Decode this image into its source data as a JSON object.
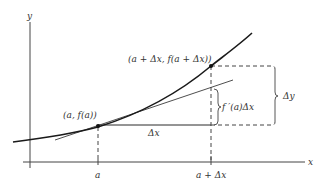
{
  "diagram": {
    "title": "",
    "axes": {
      "x_label": "x",
      "y_label": "y",
      "x_ticks": [
        {
          "label": "a"
        },
        {
          "label": "a + Δx"
        }
      ]
    },
    "points": [
      {
        "label": "(a, f(a))"
      },
      {
        "label": "(a + Δx, f(a + Δx))"
      }
    ],
    "annotations": {
      "delta_x": "Δx",
      "delta_y": "Δy",
      "differential": "f ′(a)Δx"
    },
    "elements": [
      "curve y = f(x)",
      "tangent line at (a, f(a))",
      "horizontal segment of length Δx",
      "vertical dashed guides at a and a + Δx",
      "brace for f ′(a)Δx",
      "brace for Δy"
    ],
    "colors": {
      "stroke": "#2a2a2a",
      "text": "#333333",
      "background": "#ffffff"
    }
  }
}
